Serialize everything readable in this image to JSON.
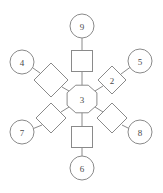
{
  "diagram": {
    "type": "radial-node-graph",
    "width": 163,
    "height": 193,
    "background_color": "#ffffff",
    "stroke_color": "#8a8a8a",
    "label_color": "#4a4a4a",
    "center": {
      "id": "center",
      "shape": "octagon",
      "label": "3",
      "x": 82,
      "y": 99,
      "radius": 15
    },
    "branches": [
      {
        "id": "branch-top",
        "direction": "top",
        "angle_deg": 270,
        "mid": {
          "id": "mid-top",
          "shape": "square",
          "label": "",
          "x": 82,
          "y": 61,
          "size": 21
        },
        "outer": {
          "id": "outer-top",
          "shape": "circle",
          "label": "9",
          "x": 82,
          "y": 26,
          "radius": 12
        }
      },
      {
        "id": "branch-upper-right",
        "direction": "upper-right",
        "angle_deg": 330,
        "mid": {
          "id": "mid-upper-right",
          "shape": "diamond",
          "label": "2",
          "x": 112,
          "y": 80,
          "size": 14
        },
        "outer": {
          "id": "outer-upper-right",
          "shape": "circle",
          "label": "5",
          "x": 140,
          "y": 61,
          "radius": 12
        }
      },
      {
        "id": "branch-lower-right",
        "direction": "lower-right",
        "angle_deg": 30,
        "mid": {
          "id": "mid-lower-right",
          "shape": "diamond",
          "label": "",
          "x": 112,
          "y": 118,
          "size": 14
        },
        "outer": {
          "id": "outer-lower-right",
          "shape": "circle",
          "label": "8",
          "x": 140,
          "y": 132,
          "radius": 12
        }
      },
      {
        "id": "branch-bottom",
        "direction": "bottom",
        "angle_deg": 90,
        "mid": {
          "id": "mid-bottom",
          "shape": "square",
          "label": "",
          "x": 82,
          "y": 137,
          "size": 21
        },
        "outer": {
          "id": "outer-bottom",
          "shape": "circle",
          "label": "6",
          "x": 82,
          "y": 168,
          "radius": 12
        }
      },
      {
        "id": "branch-lower-left",
        "direction": "lower-left",
        "angle_deg": 150,
        "mid": {
          "id": "mid-lower-left",
          "shape": "diamond",
          "label": "",
          "x": 51,
          "y": 118,
          "size": 14
        },
        "outer": {
          "id": "outer-lower-left",
          "shape": "circle",
          "label": "7",
          "x": 22,
          "y": 132,
          "radius": 12
        }
      },
      {
        "id": "branch-upper-left",
        "direction": "upper-left",
        "angle_deg": 210,
        "mid": {
          "id": "mid-upper-left",
          "shape": "diamond",
          "label": "",
          "x": 51,
          "y": 80,
          "size": 16
        },
        "outer": {
          "id": "outer-upper-left",
          "shape": "circle",
          "label": "4",
          "x": 22,
          "y": 62,
          "radius": 12
        }
      }
    ]
  }
}
